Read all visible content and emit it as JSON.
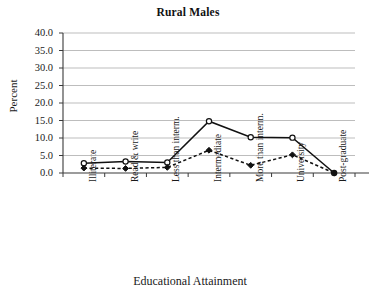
{
  "chart_data": {
    "type": "line",
    "title": "Rural Males",
    "xlabel": "Educational Attainment",
    "ylabel": "Percent",
    "categories": [
      "Illiterate",
      "Read & write",
      "Less than interm.",
      "Intermediate",
      "More than interm.",
      "University",
      "Post-graduate"
    ],
    "ylim": [
      0,
      40
    ],
    "ytick_step": 5,
    "ytick_labels": [
      "0.0",
      "5.0",
      "10.0",
      "15.0",
      "20.0",
      "25.0",
      "30.0",
      "35.0",
      "40.0"
    ],
    "grid": true,
    "legend": "none",
    "series": [
      {
        "name": "series-1",
        "marker": "open-circle",
        "line_style": "solid",
        "color": "#111111",
        "values": [
          2.8,
          3.3,
          3.0,
          14.8,
          10.2,
          10.1,
          0.0
        ]
      },
      {
        "name": "series-2",
        "marker": "filled-diamond",
        "line_style": "dashed",
        "color": "#111111",
        "values": [
          1.4,
          1.3,
          1.6,
          6.5,
          2.2,
          5.2,
          0.0
        ]
      }
    ]
  }
}
